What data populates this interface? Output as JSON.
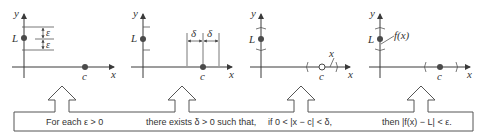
{
  "panels": [
    {
      "id": "epsilon-panel",
      "axis_y_label": "y",
      "axis_x_label": "x",
      "point_L_label": "L",
      "point_c_label": "c",
      "epsilon_upper": "ε",
      "epsilon_lower": "ε"
    },
    {
      "id": "delta-panel",
      "axis_y_label": "y",
      "axis_x_label": "x",
      "point_L_label": "L",
      "point_c_label": "c",
      "delta_left": "δ",
      "delta_right": "δ"
    },
    {
      "id": "x-interval-panel",
      "axis_y_label": "y",
      "axis_x_label": "x",
      "point_L_label": "L",
      "point_c_label": "c",
      "x_point_label": "x"
    },
    {
      "id": "fx-panel",
      "axis_y_label": "y",
      "axis_x_label": "x",
      "point_L_label": "L",
      "point_c_label": "c",
      "fx_label": "f(x)"
    }
  ],
  "statement": {
    "part1": "For each ε > 0",
    "part2": "there exists δ > 0 such that,",
    "part3": "if 0 < |x − c| < δ,",
    "part4": "then |f(x) − L| < ε."
  },
  "colors": {
    "line": "#3a3a3a",
    "point": "#4a4a4a",
    "text": "#333333",
    "background": "#ffffff"
  }
}
